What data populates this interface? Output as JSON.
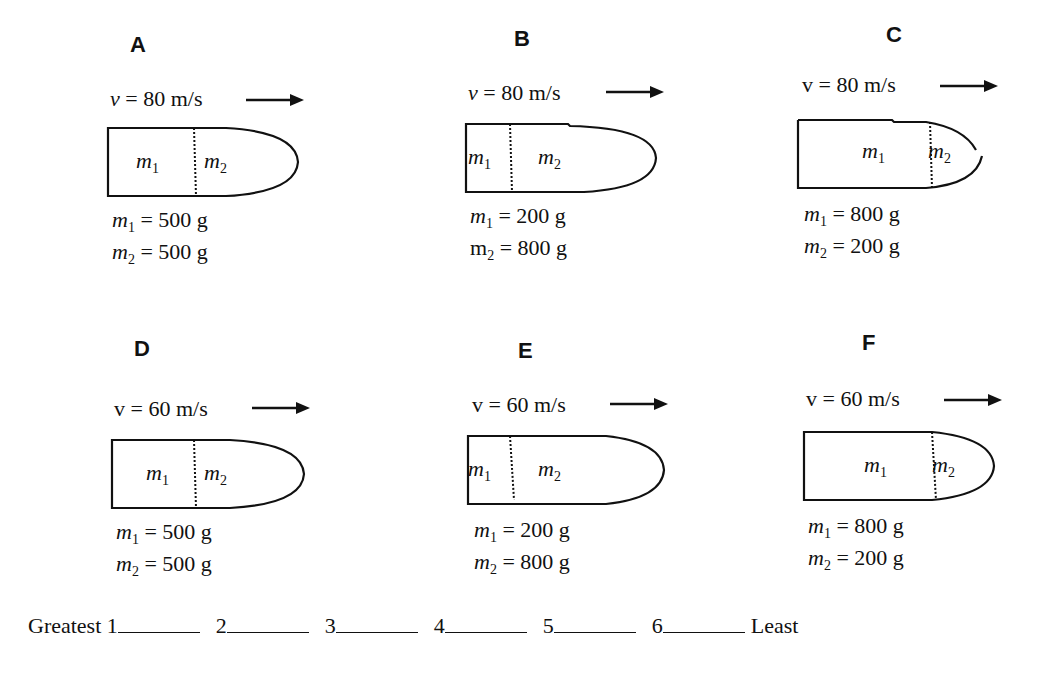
{
  "panels": [
    {
      "letter": "A",
      "v_symbol": "v",
      "v_italic": true,
      "velocity": "= 80 m/s",
      "m1_label": "m",
      "m1_sub": "1",
      "m2_label": "m",
      "m2_sub": "2",
      "m1_value": "= 500 g",
      "m2_value": "= 500 g",
      "divider_frac": 0.46,
      "tip": "closed"
    },
    {
      "letter": "B",
      "v_symbol": "v",
      "v_italic": true,
      "velocity": "= 80 m/s",
      "m1_label": "m",
      "m1_sub": "1",
      "m2_label": "m",
      "m2_sub": "2",
      "m1_value": "= 200 g",
      "m2_value": "= 800 g",
      "divider_frac": 0.2,
      "tip": "closed"
    },
    {
      "letter": "C",
      "v_symbol": "v",
      "v_italic": false,
      "velocity": "= 80 m/s",
      "m1_label": "m",
      "m1_sub": "1",
      "m2_label": "m",
      "m2_sub": "2",
      "m1_value": "= 800 g",
      "m2_value": "= 200 g",
      "divider_frac": 0.68,
      "tip": "open"
    },
    {
      "letter": "D",
      "v_symbol": "v",
      "v_italic": false,
      "velocity": "= 60 m/s",
      "m1_label": "m",
      "m1_sub": "1",
      "m2_label": "m",
      "m2_sub": "2",
      "m1_value": "= 500 g",
      "m2_value": "= 500 g",
      "divider_frac": 0.46,
      "tip": "closed"
    },
    {
      "letter": "E",
      "v_symbol": "v",
      "v_italic": false,
      "velocity": "= 60 m/s",
      "m1_label": "m",
      "m1_sub": "1",
      "m2_label": "m",
      "m2_sub": "2",
      "m1_value": "= 200 g",
      "m2_value": "= 800 g",
      "divider_frac": 0.25,
      "tip": "closed"
    },
    {
      "letter": "F",
      "v_symbol": "v",
      "v_italic": false,
      "velocity": "= 60 m/s",
      "m1_label": "m",
      "m1_sub": "1",
      "m2_label": "m",
      "m2_sub": "2",
      "m1_value": "= 800 g",
      "m2_value": "= 200 g",
      "divider_frac": 0.68,
      "tip": "closed"
    }
  ],
  "ranking": {
    "greatest_label": "Greatest",
    "slots": [
      "1",
      "2",
      "3",
      "4",
      "5",
      "6"
    ],
    "least_label": "Least"
  }
}
